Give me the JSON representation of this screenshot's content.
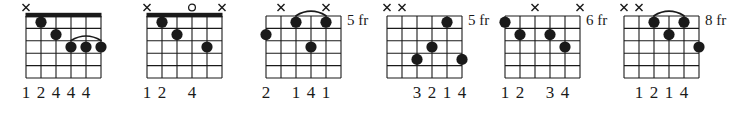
{
  "figure": {
    "kind": "guitar-chord-diagram-row",
    "background": "#ffffff",
    "ink": "#1a1a1a",
    "strings": 6,
    "frets": 5
  },
  "chart_data": {
    "type": "table",
    "title": "",
    "xlabel": "",
    "ylabel": "",
    "categories": [
      "chord-1",
      "chord-2",
      "chord-3",
      "chord-4",
      "chord-5",
      "chord-6"
    ],
    "series": [
      {
        "name": "dots-per-chord",
        "values": [
          5,
          3,
          4,
          4,
          4,
          4
        ]
      }
    ],
    "chords": [
      {
        "index": 1,
        "nut": true,
        "position_label": "",
        "fingering": "12444",
        "fingering_digits": [
          "1",
          "2",
          "4",
          "4",
          "4"
        ],
        "open_muted": [
          {
            "string": 1,
            "marker": "x"
          }
        ],
        "dots": [
          {
            "string": 2,
            "fret": 1
          },
          {
            "string": 3,
            "fret": 2
          },
          {
            "string": 4,
            "fret": 3
          },
          {
            "string": 5,
            "fret": 3
          },
          {
            "string": 6,
            "fret": 3
          }
        ],
        "arc": {
          "from_string": 4,
          "to_string": 6,
          "fret": 3
        }
      },
      {
        "index": 2,
        "nut": true,
        "position_label": "",
        "fingering": "12 4",
        "fingering_digits": [
          "1",
          "2",
          "",
          "4",
          ""
        ],
        "open_muted": [
          {
            "string": 1,
            "marker": "x"
          },
          {
            "string": 4,
            "marker": "o"
          },
          {
            "string": 6,
            "marker": "x"
          }
        ],
        "dots": [
          {
            "string": 2,
            "fret": 1
          },
          {
            "string": 3,
            "fret": 2
          },
          {
            "string": 5,
            "fret": 3
          }
        ],
        "arc": null
      },
      {
        "index": 3,
        "nut": false,
        "position_label": "5 fr",
        "fingering": "2 141",
        "fingering_digits": [
          "2",
          "",
          "1",
          "4",
          "1"
        ],
        "open_muted": [
          {
            "string": 2,
            "marker": "x"
          },
          {
            "string": 5,
            "marker": "x"
          }
        ],
        "dots": [
          {
            "string": 1,
            "fret": 2
          },
          {
            "string": 3,
            "fret": 1
          },
          {
            "string": 4,
            "fret": 3
          },
          {
            "string": 5,
            "fret": 1
          }
        ],
        "arc": {
          "from_string": 3,
          "to_string": 5,
          "fret": 1
        }
      },
      {
        "index": 4,
        "nut": false,
        "position_label": "5 fr",
        "fingering": "3214",
        "fingering_digits": [
          "",
          "",
          "3",
          "2",
          "1",
          "4"
        ],
        "open_muted": [
          {
            "string": 1,
            "marker": "x"
          },
          {
            "string": 2,
            "marker": "x"
          }
        ],
        "dots": [
          {
            "string": 3,
            "fret": 4
          },
          {
            "string": 4,
            "fret": 3
          },
          {
            "string": 5,
            "fret": 1
          },
          {
            "string": 6,
            "fret": 4
          }
        ],
        "arc": null
      },
      {
        "index": 5,
        "nut": false,
        "position_label": "6 fr",
        "fingering": "12 34",
        "fingering_digits": [
          "1",
          "2",
          "",
          "3",
          "4"
        ],
        "open_muted": [
          {
            "string": 3,
            "marker": "x"
          },
          {
            "string": 6,
            "marker": "x"
          }
        ],
        "dots": [
          {
            "string": 1,
            "fret": 1
          },
          {
            "string": 2,
            "fret": 2
          },
          {
            "string": 4,
            "fret": 2
          },
          {
            "string": 5,
            "fret": 3
          }
        ],
        "arc": null
      },
      {
        "index": 6,
        "nut": false,
        "position_label": "8 fr",
        "fingering": "1214",
        "fingering_digits": [
          "",
          "1",
          "2",
          "1",
          "4"
        ],
        "open_muted": [
          {
            "string": 1,
            "marker": "x"
          },
          {
            "string": 2,
            "marker": "x"
          }
        ],
        "dots": [
          {
            "string": 3,
            "fret": 1
          },
          {
            "string": 4,
            "fret": 2
          },
          {
            "string": 5,
            "fret": 1
          },
          {
            "string": 6,
            "fret": 3
          }
        ],
        "arc": {
          "from_string": 3,
          "to_string": 5,
          "fret": 1
        }
      }
    ]
  },
  "layout": {
    "offsets": [
      26,
      147,
      266,
      387,
      505,
      624
    ],
    "cell_w": 15,
    "cell_h": 12.4,
    "grid_top": 16,
    "dot_r": 5.6
  }
}
